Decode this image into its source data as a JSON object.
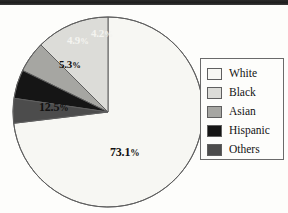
{
  "chart_data": {
    "type": "pie",
    "title": "",
    "subtitle": "",
    "xlabel": "",
    "ylabel": "",
    "grid": false,
    "legend_position": "right",
    "start_angle_deg": 0,
    "direction": "counterclockwise-for-minor-slices",
    "categories": [
      "White",
      "Black",
      "Asian",
      "Hispanic",
      "Others"
    ],
    "values": [
      73.1,
      12.5,
      5.3,
      4.9,
      4.2
    ],
    "value_unit": "%",
    "data_labels": [
      "73.1%",
      "12.5%",
      "5.3%",
      "4.9%",
      "4.2%"
    ],
    "colors": [
      "#f7f7f3",
      "#dcdcd8",
      "#a6a6a2",
      "#151515",
      "#4c4c4c"
    ],
    "slices": [
      {
        "label": "White",
        "value": 73.1,
        "display": "73.1%",
        "color": "#f7f7f3",
        "label_color": "#111111"
      },
      {
        "label": "Black",
        "value": 12.5,
        "display": "12.5%",
        "color": "#dcdcd8",
        "label_color": "#111111"
      },
      {
        "label": "Asian",
        "value": 5.3,
        "display": "5.3%",
        "color": "#a6a6a2",
        "label_color": "#111111"
      },
      {
        "label": "Hispanic",
        "value": 4.9,
        "display": "4.9%",
        "color": "#151515",
        "label_color": "#f4f4f0"
      },
      {
        "label": "Others",
        "value": 4.2,
        "display": "4.2%",
        "color": "#4c4c4c",
        "label_color": "#f4f4f0"
      }
    ]
  },
  "labels": {
    "white": "73.1%",
    "black": "12.5%",
    "asian": "5.3%",
    "hispanic": "4.9%",
    "others": "4.2%"
  },
  "label_parts": {
    "white_num": "73.1",
    "white_pct": "%",
    "black_num": "12.5",
    "black_pct": "%",
    "asian_num": "5.3",
    "asian_pct": "%",
    "hispanic_num": "4.9",
    "hispanic_pct": "%",
    "others_num": "4.2",
    "others_pct": "%"
  },
  "legend": {
    "items": [
      {
        "label": "White",
        "color": "#f7f7f3"
      },
      {
        "label": "Black",
        "color": "#dcdcd8"
      },
      {
        "label": "Asian",
        "color": "#a6a6a2"
      },
      {
        "label": "Hispanic",
        "color": "#151515"
      },
      {
        "label": "Others",
        "color": "#4c4c4c"
      }
    ]
  },
  "style": {
    "outline_color": "#5f5f5f",
    "page_background": "#fdfdfb"
  }
}
